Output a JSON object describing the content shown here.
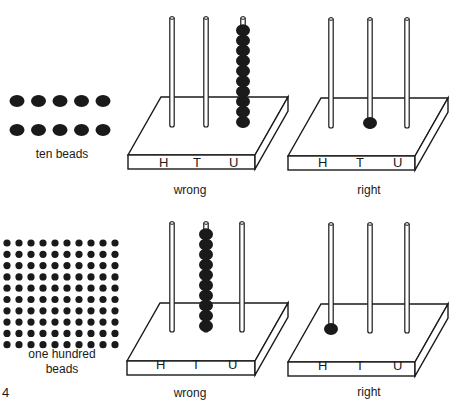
{
  "figure_number": "4",
  "rows": [
    {
      "beads_caption": "ten beads",
      "bead_count": 10,
      "bead_layout": {
        "rows": 2,
        "cols": 5
      },
      "panels": [
        {
          "caption": "wrong",
          "columns": [
            "H",
            "T",
            "U"
          ],
          "beads_on": "U",
          "bead_count": 10
        },
        {
          "caption": "right",
          "columns": [
            "H",
            "T",
            "U"
          ],
          "beads_on": "T",
          "bead_count": 1
        }
      ]
    },
    {
      "beads_caption_line1": "one hundred",
      "beads_caption_line2": "beads",
      "bead_count": 100,
      "bead_layout": {
        "rows": 10,
        "cols": 10
      },
      "panels": [
        {
          "caption": "wrong",
          "columns": [
            "H",
            "T",
            "U"
          ],
          "beads_on": "T",
          "bead_count": 10
        },
        {
          "caption": "right",
          "columns": [
            "H",
            "T",
            "U"
          ],
          "beads_on": "H",
          "bead_count": 1
        }
      ]
    }
  ],
  "colors": {
    "ink": "#1a1a1a",
    "background": "#ffffff"
  }
}
